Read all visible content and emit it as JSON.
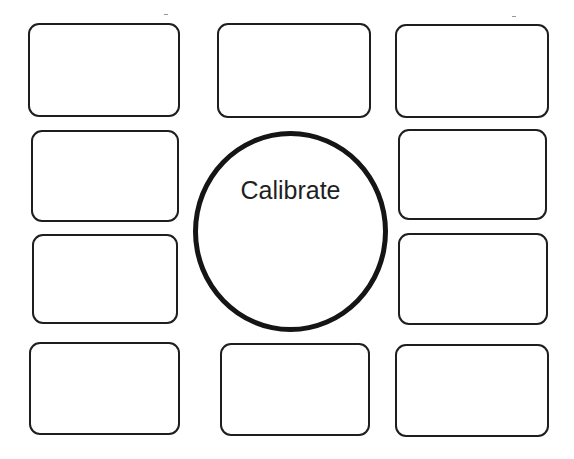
{
  "diagram": {
    "center": {
      "shape": "circle",
      "label": "Calibrate"
    },
    "boxes": [
      {
        "id": "top-left",
        "label": ""
      },
      {
        "id": "top-center",
        "label": ""
      },
      {
        "id": "top-right",
        "label": ""
      },
      {
        "id": "middle-upper-left",
        "label": ""
      },
      {
        "id": "middle-upper-right",
        "label": ""
      },
      {
        "id": "middle-lower-left",
        "label": ""
      },
      {
        "id": "middle-lower-right",
        "label": ""
      },
      {
        "id": "bottom-left",
        "label": ""
      },
      {
        "id": "bottom-center",
        "label": ""
      },
      {
        "id": "bottom-right",
        "label": ""
      }
    ],
    "colors": {
      "stroke": "#1e1e1e",
      "background": "#ffffff",
      "text": "#1f1f1f"
    }
  }
}
